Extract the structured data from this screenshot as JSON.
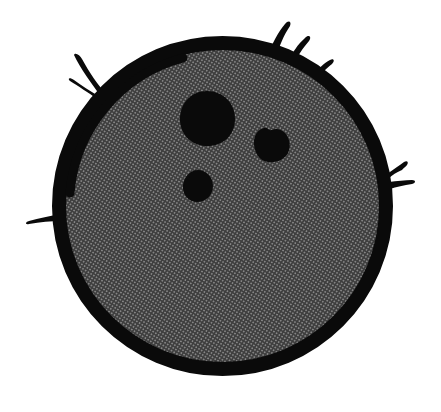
{
  "counts": {
    "eyes": 3,
    "husk_tufts": 8
  },
  "colors": {
    "paper": "#ffffff",
    "ink": "#0a0a0a",
    "halftone_base": "#3e3e3e",
    "halftone_dot": "#8f8f8f"
  },
  "shapes": {
    "body": "M 222.5,43 C 312.8,43 386,116 386,206 C 386,296 312.8,369 222.5,369 C 132.2,369 59,296 59,206 C 59,116 132.2,43 222.5,43 Z",
    "rim_accent": "M 70,193 A 153,153 0 0 1 183,58",
    "eyes": {
      "large": "M 207,91 C 223,91 235,103 235,119 C 235,136 222,147 205,146 C 190,145 179,133 180,117 C 181,102 192,91 207,91 Z",
      "right": "M 254,145 C 253,136 258,129 264,128 C 268,127 268,131 272,130 C 276,128 281,129 285,133 C 290,138 291,147 288,153 C 284,160 276,163 268,162 C 260,161 255,154 254,145 Z",
      "small": "M 198,170 C 206,170 213,177 213,186 C 213,195 206,202 197,202 C 189,202 182,195 183,185 C 184,177 190,170 198,170 Z"
    },
    "tufts": {
      "top_left_1": "M 107,95 C 98,85 89,72 82,59 C 80,55 75,52 74,55 C 80,68 92,84 102,98 Z",
      "top_left_2": "M 100,97 C 90,91 81,85 74,80 C 70,77 67,78 70,81 C 78,86 89,93 97,99 Z",
      "top_right_1": "M 268,55 C 272,44 278,32 285,24 C 288,20 292,21 290,26 C 284,35 279,46 277,56 Z",
      "top_right_2": "M 288,62 C 292,53 298,44 305,38 C 309,34 312,37 309,41 C 303,48 297,56 295,64 Z",
      "top_right_3": "M 313,76 C 318,69 324,63 330,60 C 334,58 335,61 332,64 C 327,68 321,73 318,79 Z",
      "right_1": "M 387,174 C 394,169 400,165 404,162 C 407,160 409,162 407,165 C 406,167 403,168 402,170 C 397,172 392,175 388,179 Z",
      "right_2": "M 389,182 C 397,181 405,180 412,180 C 416,180 416,183 412,184 C 404,185 396,187 390,189 Z",
      "left_1": "M 61,214 C 50,216 39,218 29,221 C 25,222 25,225 29,224 C 40,222 51,221 61,221 Z"
    }
  }
}
